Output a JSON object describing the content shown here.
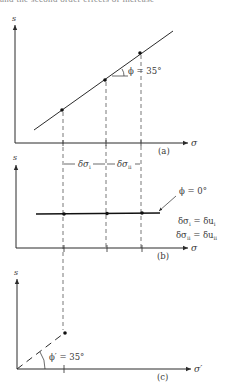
{
  "header_fragment": "and the second order effects of increase",
  "panels": {
    "a": {
      "label": "(a)",
      "y_axis": "s",
      "x_axis": "σ",
      "angle_label": "ϕ = 35°",
      "points": [
        [
          62,
          110
        ],
        [
          105,
          80
        ],
        [
          139,
          53
        ]
      ]
    },
    "b": {
      "label": "(b)",
      "y_axis": "s",
      "x_axis": "σ",
      "increment_1": "δσ",
      "increment_1_sub": "i",
      "increment_2": "δσ",
      "increment_2_sub": "ii",
      "angle_label": "ϕ = 0°",
      "eq1_lhs": "δσ",
      "eq1_lhs_sub": "i",
      "eq1_rhs": " = δu",
      "eq1_rhs_sub": "i",
      "eq2_lhs": "δσ",
      "eq2_lhs_sub": "ii",
      "eq2_rhs": " = δu",
      "eq2_rhs_sub": "ii"
    },
    "c": {
      "label": "(c)",
      "y_axis": "s",
      "x_axis": "σ′",
      "angle_label": "ϕ′ = 35°"
    }
  },
  "colors": {
    "ink": "#2b2b2b",
    "dashed": "#555555",
    "background": "#ffffff"
  }
}
